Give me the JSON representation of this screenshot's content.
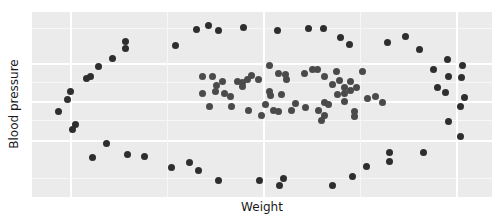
{
  "chart_data": {
    "type": "scatter",
    "title": "",
    "xlabel": "Weight",
    "ylabel": "Blood pressure",
    "xlim": [
      0,
      460
    ],
    "ylim": [
      0,
      185
    ],
    "grid": true,
    "legend": null,
    "tick_labels": {
      "x": [],
      "y": []
    },
    "note": "No tick labels shown; coordinates are in panel-relative pixel units (x right, y up from bottom of panel).",
    "colors": {
      "panel": "#ebebeb",
      "grid": "#ffffff",
      "outer_points": "#2e2e2e",
      "inner_points": "#4a4a4a"
    },
    "series": [
      {
        "name": "outer ring",
        "points": [
          [
            93,
            156
          ],
          [
            93,
            149
          ],
          [
            143,
            152
          ],
          [
            164,
            168
          ],
          [
            176,
            172
          ],
          [
            186,
            167
          ],
          [
            211,
            170
          ],
          [
            245,
            167
          ],
          [
            276,
            169
          ],
          [
            291,
            169
          ],
          [
            308,
            160
          ],
          [
            317,
            153
          ],
          [
            355,
            155
          ],
          [
            373,
            161
          ],
          [
            387,
            148
          ],
          [
            401,
            128
          ],
          [
            405,
            110
          ],
          [
            415,
            138
          ],
          [
            416,
            121
          ],
          [
            429,
            120
          ],
          [
            432,
            100
          ],
          [
            430,
            132
          ],
          [
            428,
            91
          ],
          [
            413,
            105
          ],
          [
            416,
            76
          ],
          [
            428,
            61
          ],
          [
            357,
            45
          ],
          [
            357,
            36
          ],
          [
            391,
            45
          ],
          [
            334,
            31
          ],
          [
            320,
            21
          ],
          [
            300,
            12
          ],
          [
            251,
            19
          ],
          [
            247,
            12
          ],
          [
            227,
            17
          ],
          [
            186,
            17
          ],
          [
            166,
            27
          ],
          [
            157,
            35
          ],
          [
            139,
            30
          ],
          [
            112,
            41
          ],
          [
            95,
            43
          ],
          [
            74,
            54
          ],
          [
            60,
            40
          ],
          [
            43,
            73
          ],
          [
            40,
            68
          ],
          [
            26,
            86
          ],
          [
            35,
            98
          ],
          [
            38,
            106
          ],
          [
            54,
            119
          ],
          [
            58,
            121
          ],
          [
            66,
            131
          ],
          [
            80,
            139
          ]
        ]
      },
      {
        "name": "inner ring",
        "points": [
          [
            170,
            121
          ],
          [
            180,
            121
          ],
          [
            170,
            104
          ],
          [
            184,
            112
          ],
          [
            183,
            106
          ],
          [
            190,
            116
          ],
          [
            192,
            104
          ],
          [
            198,
            101
          ],
          [
            199,
            91
          ],
          [
            210,
            115
          ],
          [
            210,
            111
          ],
          [
            219,
            122
          ],
          [
            215,
            118
          ],
          [
            226,
            118
          ],
          [
            237,
            106
          ],
          [
            238,
            102
          ],
          [
            233,
            93
          ],
          [
            241,
            87
          ],
          [
            246,
            86
          ],
          [
            237,
            132
          ],
          [
            246,
            124
          ],
          [
            253,
            123
          ],
          [
            254,
            118
          ],
          [
            263,
            94
          ],
          [
            273,
            90
          ],
          [
            272,
            124
          ],
          [
            280,
            128
          ],
          [
            285,
            128
          ],
          [
            292,
            121
          ],
          [
            292,
            95
          ],
          [
            286,
            87
          ],
          [
            296,
            93
          ],
          [
            300,
            113
          ],
          [
            304,
            126
          ],
          [
            305,
            103
          ],
          [
            307,
            117
          ],
          [
            312,
            104
          ],
          [
            312,
            96
          ],
          [
            312,
            110
          ],
          [
            318,
            107
          ],
          [
            318,
            116
          ],
          [
            324,
            110
          ],
          [
            330,
            126
          ],
          [
            322,
            86
          ],
          [
            322,
            81
          ],
          [
            335,
            99
          ],
          [
            343,
            101
          ],
          [
            350,
            95
          ],
          [
            292,
            82
          ],
          [
            289,
            77
          ],
          [
            259,
            87
          ],
          [
            229,
            82
          ],
          [
            216,
            87
          ],
          [
            205,
            116
          ],
          [
            177,
            91
          ],
          [
            249,
            103
          ]
        ]
      }
    ]
  }
}
